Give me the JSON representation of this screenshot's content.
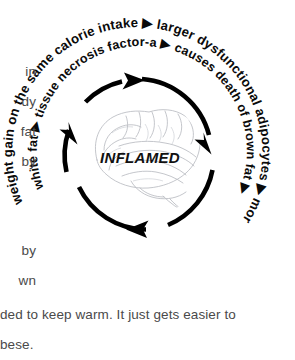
{
  "figure": {
    "center_label": "INFLAMED",
    "outer_ring_text": "weight gain on the same calorie intake ▶ larger dysfunctional adipocytes ▶ more inflammation",
    "inner_ring_text": "white fat ▶ tissue necrosis factor-a ▶ causes death of brown fat ▶",
    "outer_ring_segments": [
      "weight gain on the same calorie intake",
      "larger dysfunctional adipocytes",
      "more inflammation"
    ],
    "inner_ring_segments": [
      "white fat",
      "tissue necrosis factor-a",
      "causes death of brown fat"
    ],
    "arrow_glyph": "▶",
    "illustration": "brain-line-drawing",
    "colors": {
      "arc": "#000000",
      "ring_text": "#0a0a0a",
      "brain": "#b9bcc2",
      "body_text": "#4a4a4a"
    }
  },
  "body": {
    "fragments": [
      {
        "text": "in",
        "x": 36,
        "y": 64
      },
      {
        "text": "dy",
        "x": 36,
        "y": 94
      },
      {
        "text": "fat",
        "x": 36,
        "y": 124
      },
      {
        "text": "by",
        "x": 36,
        "y": 154
      },
      {
        "text": "by",
        "x": 36,
        "y": 243
      },
      {
        "text": "wn",
        "x": 36,
        "y": 273
      }
    ],
    "lines": [
      {
        "text": "ded to keep warm. It just gets easier to",
        "x": 0,
        "y": 307
      },
      {
        "text": "bese.",
        "x": 0,
        "y": 337
      }
    ]
  }
}
